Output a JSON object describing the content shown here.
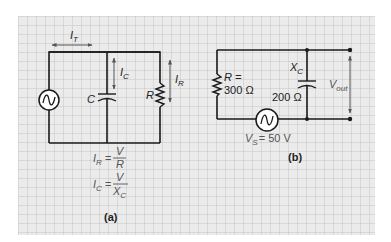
{
  "colors": {
    "background": "#ffffff",
    "grid_fill": "#ebebeb",
    "grid_line": "#bdbdbd",
    "wire": "#1a1a1a",
    "label": "#222222",
    "arrow": "#555555"
  },
  "circuit_a": {
    "caption": "(a)",
    "source_icon": "ac-source-icon",
    "labels": {
      "total_current": {
        "main": "I",
        "sub": "T"
      },
      "cap_current": {
        "main": "I",
        "sub": "C"
      },
      "res_current": {
        "main": "I",
        "sub": "R"
      },
      "capacitor": "C",
      "resistor": "R"
    },
    "equations": [
      {
        "lhs_main": "I",
        "lhs_sub": "R",
        "eq": "=",
        "numerator": "V",
        "denominator_main": "R",
        "denominator_sub": ""
      },
      {
        "lhs_main": "I",
        "lhs_sub": "C",
        "eq": "=",
        "numerator": "V",
        "denominator_main": "X",
        "denominator_sub": "C"
      }
    ]
  },
  "circuit_b": {
    "caption": "(b)",
    "source_icon": "ac-source-icon",
    "resistor": {
      "line1": "R =",
      "line2": "300 Ω"
    },
    "capacitor": {
      "main": "X",
      "sub": "C",
      "value": "200 Ω"
    },
    "output": {
      "main": "V",
      "sub": "out"
    },
    "source": {
      "main": "V",
      "sub": "S",
      "value": "= 50 V"
    }
  }
}
